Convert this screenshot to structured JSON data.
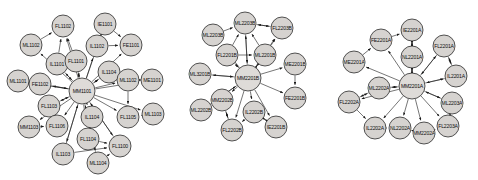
{
  "figure": {
    "type": "directed-graph-triptych",
    "background_color": "#ffffff",
    "node_fill": "#d6d3d0",
    "node_stroke": "#2b2b2b",
    "edge_color": "#1a1a1a",
    "label_color": "#111111"
  },
  "graphs": [
    {
      "id": "graph-1",
      "hub": "MM1101",
      "nodes": [
        {
          "label": "FL1102",
          "x": 63,
          "y": 26,
          "r": 11
        },
        {
          "label": "IE1101",
          "x": 105,
          "y": 24,
          "r": 11
        },
        {
          "label": "ML1102",
          "x": 31,
          "y": 45,
          "r": 11
        },
        {
          "label": "IL1102",
          "x": 97,
          "y": 46,
          "r": 11
        },
        {
          "label": "FE1101",
          "x": 131,
          "y": 45,
          "r": 11
        },
        {
          "label": "IL1101",
          "x": 57,
          "y": 64,
          "r": 11
        },
        {
          "label": "FL1101",
          "x": 76,
          "y": 61,
          "r": 11
        },
        {
          "label": "IL1104",
          "x": 109,
          "y": 72,
          "r": 11
        },
        {
          "label": "ML1101",
          "x": 18,
          "y": 81,
          "r": 11
        },
        {
          "label": "FE1102",
          "x": 40,
          "y": 84,
          "r": 11
        },
        {
          "label": "ML1102",
          "x": 128,
          "y": 80,
          "r": 11
        },
        {
          "label": "ME1101",
          "x": 152,
          "y": 80,
          "r": 11
        },
        {
          "label": "MM1101",
          "x": 82,
          "y": 91,
          "r": 13
        },
        {
          "label": "FL1103",
          "x": 49,
          "y": 106,
          "r": 11
        },
        {
          "label": "IL1104",
          "x": 92,
          "y": 117,
          "r": 11
        },
        {
          "label": "FL1105",
          "x": 128,
          "y": 117,
          "r": 11
        },
        {
          "label": "ML1103",
          "x": 153,
          "y": 114,
          "r": 11
        },
        {
          "label": "MM1103",
          "x": 29,
          "y": 127,
          "r": 11
        },
        {
          "label": "FL1106",
          "x": 57,
          "y": 126,
          "r": 11
        },
        {
          "label": "FL1104",
          "x": 88,
          "y": 139,
          "r": 11
        },
        {
          "label": "FL1100",
          "x": 120,
          "y": 146,
          "r": 11
        },
        {
          "label": "IL1103",
          "x": 63,
          "y": 154,
          "r": 11
        },
        {
          "label": "ML1104",
          "x": 98,
          "y": 163,
          "r": 11
        }
      ],
      "edges": [
        [
          12,
          0
        ],
        [
          12,
          1
        ],
        [
          12,
          2
        ],
        [
          12,
          3
        ],
        [
          12,
          4
        ],
        [
          12,
          5
        ],
        [
          12,
          6
        ],
        [
          12,
          7
        ],
        [
          12,
          8
        ],
        [
          12,
          9
        ],
        [
          12,
          10
        ],
        [
          12,
          11
        ],
        [
          12,
          13
        ],
        [
          12,
          14
        ],
        [
          12,
          15
        ],
        [
          12,
          16
        ],
        [
          12,
          17
        ],
        [
          12,
          18
        ],
        [
          12,
          19
        ],
        [
          12,
          20
        ],
        [
          12,
          21
        ],
        [
          12,
          22
        ],
        [
          5,
          0
        ],
        [
          6,
          0
        ],
        [
          3,
          1
        ],
        [
          3,
          4
        ],
        [
          1,
          4
        ],
        [
          9,
          8
        ],
        [
          9,
          12
        ],
        [
          5,
          12
        ],
        [
          6,
          12
        ],
        [
          7,
          12
        ],
        [
          10,
          15
        ],
        [
          14,
          19
        ],
        [
          19,
          20
        ],
        [
          21,
          20
        ],
        [
          22,
          20
        ],
        [
          18,
          13
        ],
        [
          16,
          15
        ],
        [
          11,
          10
        ],
        [
          2,
          0
        ],
        [
          13,
          12
        ],
        [
          17,
          18
        ],
        [
          21,
          12
        ],
        [
          22,
          12
        ],
        [
          20,
          12
        ]
      ]
    },
    {
      "id": "graph-2",
      "hub": "MM2201B",
      "nodes": [
        {
          "label": "ML2203B",
          "x": 245,
          "y": 23,
          "r": 11
        },
        {
          "label": "FL2203B",
          "x": 282,
          "y": 28,
          "r": 11
        },
        {
          "label": "ML2203B",
          "x": 213,
          "y": 35,
          "r": 11
        },
        {
          "label": "FL2201B",
          "x": 227,
          "y": 55,
          "r": 11
        },
        {
          "label": "ML2201B",
          "x": 265,
          "y": 55,
          "r": 11
        },
        {
          "label": "ML3201B",
          "x": 200,
          "y": 74,
          "r": 11
        },
        {
          "label": "ME2201B",
          "x": 295,
          "y": 64,
          "r": 11
        },
        {
          "label": "MM2201B",
          "x": 248,
          "y": 78,
          "r": 13
        },
        {
          "label": "MM2202B",
          "x": 222,
          "y": 100,
          "r": 11
        },
        {
          "label": "FE2201B",
          "x": 295,
          "y": 98,
          "r": 11
        },
        {
          "label": "ML2202B",
          "x": 201,
          "y": 110,
          "r": 11
        },
        {
          "label": "IL2202B",
          "x": 254,
          "y": 112,
          "r": 11
        },
        {
          "label": "FL2202B",
          "x": 232,
          "y": 130,
          "r": 11
        },
        {
          "label": "IE2201B",
          "x": 276,
          "y": 127,
          "r": 11
        }
      ],
      "edges": [
        [
          7,
          0
        ],
        [
          7,
          1
        ],
        [
          7,
          2
        ],
        [
          7,
          3
        ],
        [
          7,
          4
        ],
        [
          7,
          5
        ],
        [
          7,
          6
        ],
        [
          7,
          8
        ],
        [
          7,
          9
        ],
        [
          7,
          10
        ],
        [
          7,
          11
        ],
        [
          7,
          12
        ],
        [
          7,
          13
        ],
        [
          2,
          0
        ],
        [
          0,
          1
        ],
        [
          1,
          0
        ],
        [
          3,
          0
        ],
        [
          4,
          0
        ],
        [
          4,
          1
        ],
        [
          3,
          4
        ],
        [
          6,
          9
        ],
        [
          5,
          7
        ],
        [
          10,
          7
        ],
        [
          8,
          12
        ],
        [
          11,
          12
        ],
        [
          12,
          8
        ],
        [
          11,
          13
        ],
        [
          13,
          11
        ],
        [
          3,
          7
        ],
        [
          4,
          7
        ],
        [
          0,
          7
        ]
      ]
    },
    {
      "id": "graph-3",
      "hub": "MM2201A",
      "nodes": [
        {
          "label": "IE2201A",
          "x": 412,
          "y": 30,
          "r": 11
        },
        {
          "label": "FE2201A",
          "x": 381,
          "y": 40,
          "r": 11
        },
        {
          "label": "FL2201A",
          "x": 444,
          "y": 46,
          "r": 11
        },
        {
          "label": "NL2201A",
          "x": 412,
          "y": 57,
          "r": 11
        },
        {
          "label": "ME2201A",
          "x": 354,
          "y": 62,
          "r": 11
        },
        {
          "label": "IL2201A",
          "x": 456,
          "y": 76,
          "r": 11
        },
        {
          "label": "ML2202A",
          "x": 379,
          "y": 88,
          "r": 11
        },
        {
          "label": "MM2201A",
          "x": 412,
          "y": 86,
          "r": 13
        },
        {
          "label": "FL2202A",
          "x": 349,
          "y": 102,
          "r": 11
        },
        {
          "label": "ML2203A",
          "x": 452,
          "y": 103,
          "r": 11
        },
        {
          "label": "IL2202A",
          "x": 375,
          "y": 128,
          "r": 11
        },
        {
          "label": "NL2202A",
          "x": 400,
          "y": 128,
          "r": 11
        },
        {
          "label": "MM2202A",
          "x": 424,
          "y": 133,
          "r": 11
        },
        {
          "label": "FL2203A",
          "x": 448,
          "y": 126,
          "r": 11
        }
      ],
      "edges": [
        [
          7,
          0
        ],
        [
          7,
          1
        ],
        [
          7,
          2
        ],
        [
          7,
          3
        ],
        [
          7,
          4
        ],
        [
          7,
          5
        ],
        [
          7,
          6
        ],
        [
          7,
          8
        ],
        [
          7,
          9
        ],
        [
          7,
          10
        ],
        [
          7,
          11
        ],
        [
          7,
          12
        ],
        [
          7,
          13
        ],
        [
          1,
          0
        ],
        [
          3,
          0
        ],
        [
          0,
          3
        ],
        [
          2,
          5
        ],
        [
          5,
          2
        ],
        [
          4,
          1
        ],
        [
          6,
          7
        ],
        [
          8,
          6
        ],
        [
          6,
          8
        ],
        [
          8,
          10
        ],
        [
          10,
          11
        ],
        [
          11,
          12
        ],
        [
          12,
          13
        ],
        [
          13,
          9
        ],
        [
          9,
          7
        ],
        [
          5,
          7
        ],
        [
          3,
          7
        ],
        [
          2,
          7
        ]
      ]
    }
  ]
}
